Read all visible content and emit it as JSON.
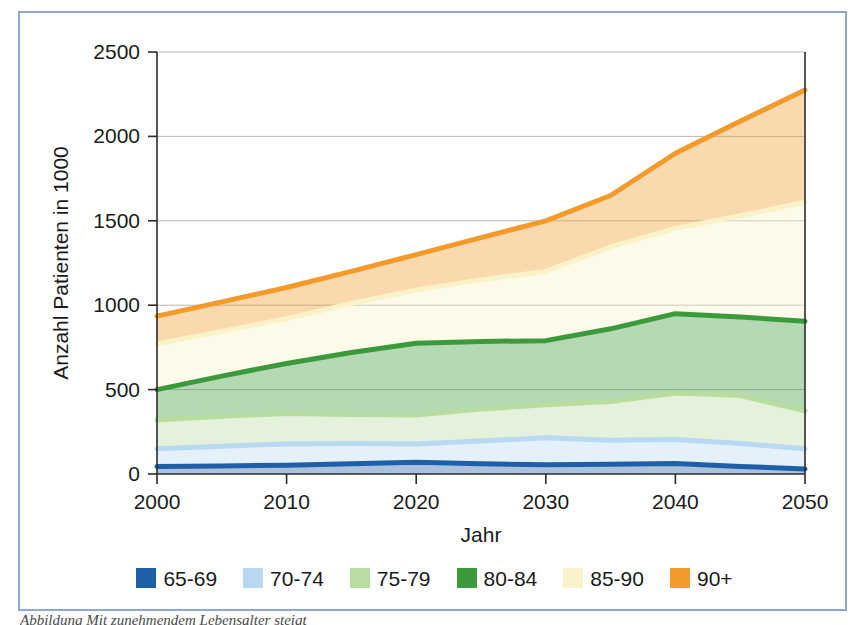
{
  "figure": {
    "frame_color": "#8aa8d0",
    "caption": "Abbildung   Mit zunehmendem Lebensalter steigt"
  },
  "chart_data": {
    "type": "area",
    "title": "",
    "xlabel": "Jahr",
    "ylabel": "Anzahl Patienten in 1000",
    "xlim": [
      2000,
      2050
    ],
    "ylim": [
      0,
      2500
    ],
    "xticks": [
      2000,
      2010,
      2020,
      2030,
      2040,
      2050
    ],
    "yticks": [
      0,
      500,
      1000,
      1500,
      2000,
      2500
    ],
    "grid": true,
    "stacked": true,
    "legend_position": "bottom",
    "x": [
      2000,
      2005,
      2010,
      2015,
      2020,
      2025,
      2030,
      2035,
      2040,
      2045,
      2050
    ],
    "series": [
      {
        "name": "65-69",
        "color": "#1f5fa8",
        "cumulative": [
          45,
          48,
          52,
          60,
          70,
          60,
          55,
          58,
          62,
          45,
          30
        ]
      },
      {
        "name": "70-74",
        "color": "#b9d8f2",
        "cumulative": [
          150,
          165,
          178,
          180,
          178,
          195,
          215,
          200,
          205,
          180,
          150
        ]
      },
      {
        "name": "75-79",
        "color": "#b9dca0",
        "cumulative": [
          320,
          342,
          358,
          352,
          350,
          385,
          410,
          430,
          480,
          465,
          375
        ]
      },
      {
        "name": "80-84",
        "color": "#3c9a3c",
        "cumulative": [
          500,
          580,
          655,
          720,
          775,
          785,
          790,
          860,
          950,
          930,
          905
        ]
      },
      {
        "name": "85-90",
        "color": "#faf2c8",
        "cumulative": [
          770,
          845,
          920,
          1010,
          1090,
          1150,
          1200,
          1345,
          1455,
          1530,
          1610
        ]
      },
      {
        "name": "90+",
        "color": "#f39a2b",
        "cumulative": [
          935,
          1020,
          1105,
          1200,
          1300,
          1400,
          1500,
          1650,
          1900,
          2090,
          2275
        ]
      }
    ]
  },
  "axes": {
    "y_label": "Anzahl Patienten in 1000",
    "x_label": "Jahr",
    "y_tick_labels": [
      "0",
      "500",
      "1000",
      "1500",
      "2000",
      "2500"
    ],
    "x_tick_labels": [
      "2000",
      "2010",
      "2020",
      "2030",
      "2040",
      "2050"
    ]
  },
  "legend": {
    "items": [
      {
        "label": "65-69",
        "color": "#1f5fa8"
      },
      {
        "label": "70-74",
        "color": "#b9d8f2"
      },
      {
        "label": "75-79",
        "color": "#b9dca0"
      },
      {
        "label": "80-84",
        "color": "#3c9a3c"
      },
      {
        "label": "85-90",
        "color": "#faf2c8"
      },
      {
        "label": "90+",
        "color": "#f39a2b"
      }
    ]
  }
}
